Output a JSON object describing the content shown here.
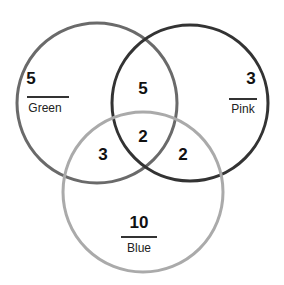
{
  "diagram": {
    "type": "venn",
    "sets": [
      {
        "name": "Green",
        "only_count": "5",
        "stroke": "#6a6a6a"
      },
      {
        "name": "Pink",
        "only_count": "3",
        "stroke": "#333333"
      },
      {
        "name": "Blue",
        "only_count": "10",
        "stroke": "#aaaaaa"
      }
    ],
    "intersections": {
      "green_pink": "5",
      "green_blue": "3",
      "pink_blue": "2",
      "all_three": "2"
    }
  }
}
